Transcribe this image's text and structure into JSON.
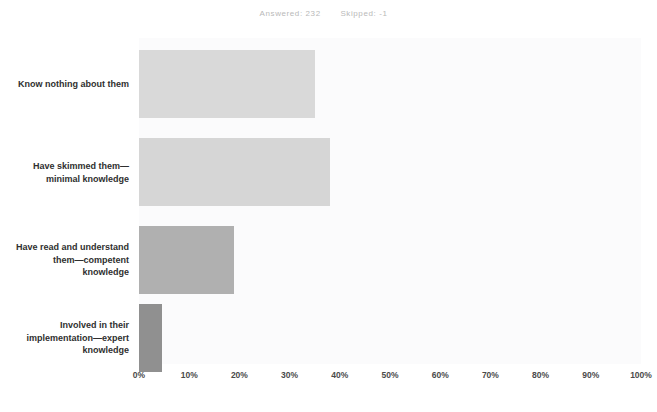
{
  "header": {
    "answered_label": "Answered: 232",
    "skipped_label": "Skipped: -1"
  },
  "chart_data": {
    "type": "bar",
    "orientation": "horizontal",
    "title": "",
    "xlabel": "",
    "ylabel": "",
    "xlim": [
      0,
      100
    ],
    "xtick_labels": [
      "0%",
      "10%",
      "20%",
      "30%",
      "40%",
      "50%",
      "60%",
      "70%",
      "80%",
      "90%",
      "100%"
    ],
    "xticks": [
      0,
      10,
      20,
      30,
      40,
      50,
      60,
      70,
      80,
      90,
      100
    ],
    "grid": false,
    "legend": null,
    "categories": [
      "Know nothing about them",
      "Have skimmed them—minimal knowledge",
      "Have read and understand them—competent knowledge",
      "Involved in their implementation—expert knowledge"
    ],
    "values": [
      35,
      38,
      19,
      4.5
    ],
    "bar_colors": [
      "#d9d9d9",
      "#d6d6d6",
      "#b0b0b0",
      "#909090"
    ],
    "plot_background": "#fbfbfc"
  }
}
